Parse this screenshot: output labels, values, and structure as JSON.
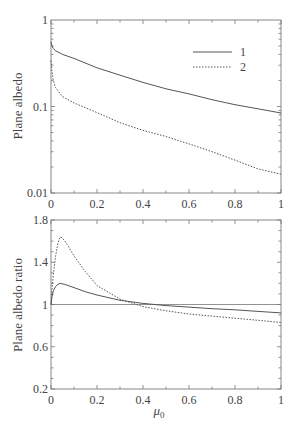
{
  "chart_data": [
    {
      "type": "line",
      "title": "",
      "xlabel": "",
      "ylabel": "Plane albedo",
      "yscale": "log",
      "xlim": [
        0,
        1
      ],
      "ylim": [
        0.01,
        1
      ],
      "xticks": [
        "0",
        "0.2",
        "0.4",
        "0.6",
        "0.8",
        "1"
      ],
      "yticks": [
        "0.01",
        "0.1",
        "1"
      ],
      "grid": false,
      "legend_position": "upper right",
      "series": [
        {
          "name": "1",
          "style": "solid",
          "x": [
            0.0,
            0.005,
            0.01,
            0.02,
            0.05,
            0.1,
            0.2,
            0.3,
            0.4,
            0.5,
            0.6,
            0.7,
            0.8,
            0.9,
            1.0
          ],
          "y": [
            0.56,
            0.5,
            0.47,
            0.44,
            0.4,
            0.36,
            0.28,
            0.23,
            0.19,
            0.16,
            0.14,
            0.12,
            0.105,
            0.094,
            0.084
          ]
        },
        {
          "name": "2",
          "style": "dotted",
          "x": [
            0.0,
            0.005,
            0.01,
            0.02,
            0.05,
            0.1,
            0.2,
            0.3,
            0.4,
            0.5,
            0.6,
            0.7,
            0.8,
            0.9,
            1.0
          ],
          "y": [
            0.34,
            0.25,
            0.2,
            0.165,
            0.13,
            0.11,
            0.085,
            0.065,
            0.053,
            0.045,
            0.037,
            0.03,
            0.024,
            0.019,
            0.0165
          ]
        }
      ]
    },
    {
      "type": "line",
      "title": "",
      "xlabel": "μ0",
      "ylabel": "Plane albedo ratio",
      "yscale": "linear",
      "xlim": [
        0,
        1
      ],
      "ylim": [
        0.2,
        1.8
      ],
      "xticks": [
        "0",
        "0.2",
        "0.4",
        "0.6",
        "0.8",
        "1"
      ],
      "yticks": [
        "0.2",
        "0.6",
        "1",
        "1.4",
        "1.8"
      ],
      "grid": false,
      "reference_line": 1.0,
      "series": [
        {
          "name": "1",
          "style": "solid",
          "x": [
            0.0,
            0.005,
            0.01,
            0.02,
            0.03,
            0.04,
            0.06,
            0.1,
            0.15,
            0.2,
            0.3,
            0.4,
            0.5,
            0.6,
            0.7,
            0.8,
            0.9,
            1.0
          ],
          "y": [
            1.0,
            1.08,
            1.13,
            1.17,
            1.19,
            1.2,
            1.19,
            1.16,
            1.12,
            1.09,
            1.04,
            1.01,
            0.99,
            0.975,
            0.96,
            0.95,
            0.935,
            0.92
          ]
        },
        {
          "name": "2",
          "style": "dotted",
          "x": [
            0.0,
            0.005,
            0.01,
            0.02,
            0.03,
            0.04,
            0.05,
            0.07,
            0.1,
            0.15,
            0.2,
            0.3,
            0.4,
            0.5,
            0.6,
            0.7,
            0.8,
            0.9,
            1.0
          ],
          "y": [
            1.0,
            1.15,
            1.28,
            1.46,
            1.58,
            1.64,
            1.63,
            1.57,
            1.46,
            1.31,
            1.18,
            1.05,
            0.98,
            0.94,
            0.91,
            0.89,
            0.87,
            0.85,
            0.83
          ]
        }
      ]
    }
  ],
  "legend": {
    "entries": [
      {
        "label": "1",
        "style": "solid"
      },
      {
        "label": "2",
        "style": "dotted"
      }
    ]
  },
  "colors": {
    "line": "#555555",
    "axis": "#777777",
    "text": "#444444"
  }
}
